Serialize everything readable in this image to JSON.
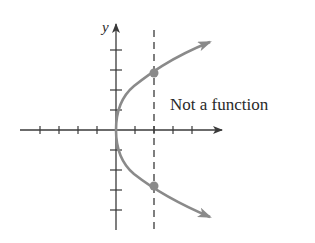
{
  "diagram": {
    "type": "vertical-line-test",
    "y_axis_label": "y",
    "annotation": "Not a function",
    "colors": {
      "axis": "#3a3a3a",
      "curve": "#8a8a8a",
      "dashed_line": "#3a3a3a",
      "points": "#8a8a8a",
      "text": "#2a2a2a"
    },
    "axes": {
      "x_ticks_left": 4,
      "x_ticks_right": 4,
      "y_ticks_up": 4,
      "y_ticks_down": 4
    },
    "curve": {
      "description": "Parabola opening to the right, vertex at origin (x = y^2 form)",
      "vertex": [
        0,
        0
      ]
    },
    "vertical_line": {
      "x": 2,
      "style": "dashed",
      "intersections": [
        [
          2,
          3
        ],
        [
          2,
          -3
        ]
      ]
    }
  }
}
